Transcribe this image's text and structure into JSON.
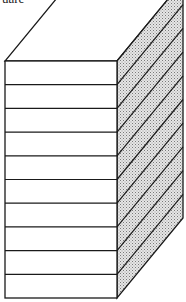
{
  "diagram": {
    "caption": "uare",
    "type": "stacked-slabs-isometric-block",
    "slab_count": 10,
    "colors": {
      "line": "#1a1a1a",
      "front_face": "#ffffff",
      "side_face_fill": "#cfcfcf",
      "background": "#ffffff"
    }
  }
}
